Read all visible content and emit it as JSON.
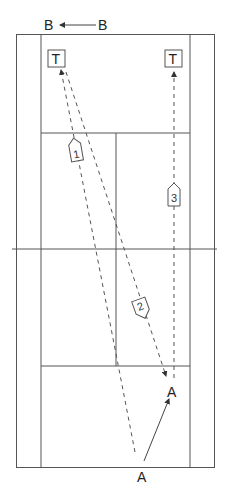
{
  "diagram": {
    "type": "badminton-court-drill",
    "labels": {
      "top_left_player": "B",
      "top_right_player": "B",
      "target_left": "T",
      "target_right": "T",
      "player_a_start": "A",
      "player_a_end": "A"
    },
    "shots": [
      {
        "id": "1",
        "label": "1",
        "from": "bottom-center",
        "to": "target-left"
      },
      {
        "id": "2",
        "label": "2",
        "from": "target-left",
        "to": "player-a-end"
      },
      {
        "id": "3",
        "label": "3",
        "from": "player-a-end",
        "to": "target-right"
      }
    ],
    "movements": [
      {
        "player": "B",
        "direction": "right-to-left"
      },
      {
        "player": "A",
        "direction": "bottom-center to right front"
      }
    ],
    "colors": {
      "line": "#555555",
      "background": "#ffffff"
    }
  }
}
